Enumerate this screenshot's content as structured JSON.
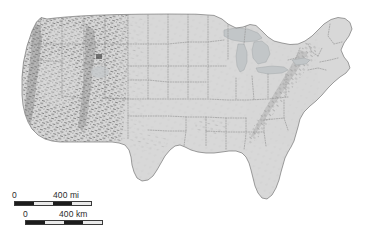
{
  "figure": {
    "kind": "shaded-relief-map",
    "subject": "Contiguous United States",
    "alt": "Shaded relief map of the contiguous United States with dotted state boundaries",
    "background_color": "#ffffff",
    "land_color": "#d8d8d8",
    "land_edge_color": "#6e6e6e",
    "lake_color": "#c2c6c8",
    "state_border_color": "#9a9a9a",
    "relief_shadow_color": "#6d6d6d",
    "scalebar_text_color": "#2b2b2b"
  },
  "scale_bar": {
    "name": "map-scale-bar",
    "miles": {
      "zero_label": "0",
      "max_label": "400 mi",
      "value": 400,
      "unit": "mi",
      "segments": 4
    },
    "kilometers": {
      "zero_label": "0",
      "max_label": "400 km",
      "value": 400,
      "unit": "km",
      "segments": 4
    }
  },
  "map_features": {
    "lakes": [
      "Lake Superior",
      "Lake Michigan",
      "Lake Huron",
      "Lake Erie",
      "Lake Ontario"
    ],
    "relief_regions": [
      "Rocky Mountains",
      "Sierra Nevada",
      "Cascade Range",
      "Great Basin",
      "Colorado Plateau",
      "Appalachian Mountains",
      "Ozark Plateau"
    ]
  }
}
